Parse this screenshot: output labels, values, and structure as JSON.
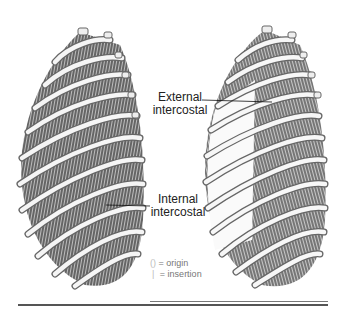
{
  "figure": {
    "left_panel": {
      "name": "ribcage-internal-view",
      "label_line1": "Internal",
      "label_line2": "intercostal"
    },
    "right_panel": {
      "name": "ribcage-external-view",
      "label_line1": "External",
      "label_line2": "intercostal"
    },
    "legend": {
      "origin_symbol": "()",
      "origin_text": "= origin",
      "insertion_symbol": "|",
      "insertion_text": "= insertion"
    },
    "colors": {
      "bone": "#f4f4f4",
      "bone_outline": "#555555",
      "muscle": "#3a3a3a",
      "rule": "#555555"
    }
  }
}
